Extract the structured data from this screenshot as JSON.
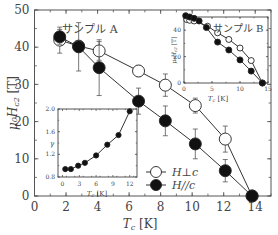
{
  "chart_data": [
    {
      "id": "main",
      "type": "line",
      "title": "",
      "annotation": "サンプル A",
      "xlabel": "Tc [K]",
      "ylabel": "μ0Hc2 [T]",
      "xlim": [
        0,
        15
      ],
      "ylim": [
        0,
        50
      ],
      "xticks": [
        0,
        2,
        4,
        6,
        8,
        10,
        12,
        14
      ],
      "yticks": [
        0,
        10,
        20,
        30,
        40,
        50
      ],
      "grid": false,
      "legend_position": "lower-right",
      "series": [
        {
          "name": "H⊥c",
          "marker": "open-circle",
          "x": [
            1.6,
            2.8,
            4.1,
            6.6,
            8.3,
            10.2,
            12.1,
            13.8
          ],
          "y": [
            41.9,
            40.3,
            39.0,
            33.6,
            29.8,
            24.3,
            15.3,
            0.0
          ],
          "yerr": [
            3.5,
            1.5,
            2.5,
            1.5,
            3.0,
            2.0,
            3.5,
            0
          ]
        },
        {
          "name": "H//c",
          "marker": "filled-circle",
          "x": [
            1.6,
            2.8,
            4.1,
            6.6,
            8.3,
            10.2,
            12.1,
            13.8
          ],
          "y": [
            42.8,
            40.1,
            34.5,
            25.5,
            20.2,
            14.0,
            6.8,
            0.0
          ],
          "yerr": [
            2.0,
            6.5,
            7.5,
            3.5,
            4.0,
            4.0,
            3.0,
            0
          ]
        }
      ]
    },
    {
      "id": "inset-sample-b",
      "type": "line",
      "annotation": "サンプル B",
      "xlabel": "Tc [K]",
      "ylabel": "μ0Hc2 [T]",
      "xlim": [
        0,
        15
      ],
      "ylim": [
        0,
        50
      ],
      "xticks": [
        0,
        5,
        10,
        15
      ],
      "yticks": [
        0,
        20,
        40
      ],
      "series": [
        {
          "name": "H⊥c",
          "marker": "open-circle",
          "x": [
            0.5,
            1.0,
            1.8,
            4.2,
            6.0,
            8.0,
            10.0,
            12.0,
            14.0
          ],
          "y": [
            48.0,
            47.5,
            47.0,
            43.0,
            38.0,
            33.0,
            26.5,
            17.0,
            0.0
          ]
        },
        {
          "name": "H//c",
          "marker": "filled-circle",
          "x": [
            0.3,
            1.0,
            1.8,
            2.7,
            4.0,
            6.0,
            8.0,
            10.0,
            12.0,
            14.0
          ],
          "y": [
            51.0,
            50.0,
            49.0,
            47.0,
            42.0,
            31.0,
            25.0,
            17.5,
            9.0,
            0.0
          ]
        }
      ]
    },
    {
      "id": "inset-gamma",
      "type": "line",
      "xlabel": "Tc [K]",
      "ylabel": "γ",
      "xlim": [
        -0.8,
        13.3
      ],
      "ylim": [
        0.8,
        2.0
      ],
      "xticks": [
        0,
        3,
        6,
        9,
        12
      ],
      "yticks": [
        0.8,
        1.2,
        1.6,
        2.0
      ],
      "series": [
        {
          "name": "γ",
          "marker": "filled-circle",
          "x": [
            0.5,
            1.5,
            2.8,
            4.0,
            6.0,
            8.0,
            10.0,
            12.0
          ],
          "y": [
            0.94,
            0.94,
            1.0,
            1.05,
            1.18,
            1.37,
            1.54,
            1.96
          ]
        }
      ]
    }
  ],
  "labels": {
    "main_x": "T",
    "main_x_sub": "c",
    "main_x_unit": "[K]",
    "main_y": "μ₀H",
    "main_y_sub": "c2",
    "main_y_unit": "[T]",
    "sample_a": "サンプル A",
    "sample_b": "サンプル B",
    "legend_perp": "H⊥c",
    "legend_par": "H//c",
    "gamma": "γ"
  }
}
